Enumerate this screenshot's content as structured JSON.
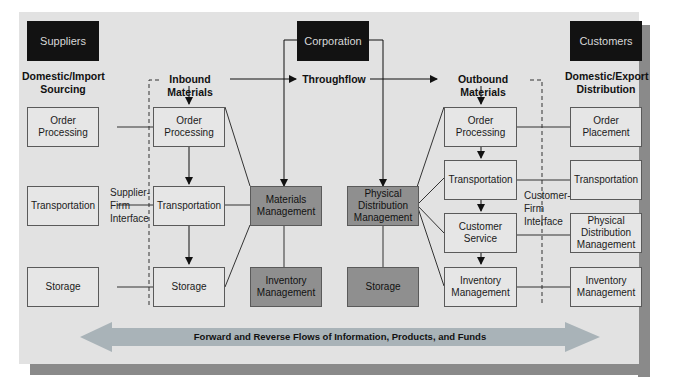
{
  "diagram": {
    "title_boxes": {
      "suppliers": "Suppliers",
      "corporation": "Corporation",
      "customers": "Customers"
    },
    "headings": {
      "domestic_import": "Domestic/Import\nSourcing",
      "inbound": "Inbound Materials",
      "throughflow": "Throughflow",
      "outbound": "Outbound Materials",
      "domestic_export": "Domestic/Export\nDistribution"
    },
    "supplier_column": [
      "Order\nProcessing",
      "Transportation",
      "Storage"
    ],
    "inbound_column": [
      "Order\nProcessing",
      "Transportation",
      "Storage"
    ],
    "materials": {
      "materials_management": "Materials\nManagement",
      "inventory_management": "Inventory\nManagement"
    },
    "distribution": {
      "physical_distribution": "Physical\nDistribution\nManagement",
      "storage": "Storage"
    },
    "outbound_column": [
      "Order\nProcessing",
      "Transportation",
      "Customer\nService",
      "Inventory\nManagement"
    ],
    "customer_column": [
      "Order\nPlacement",
      "Transportation",
      "Physical\nDistribution\nManagement",
      "Inventory\nManagement"
    ],
    "interfaces": {
      "supplier_firm": "Supplier-\nFirm\nInterface",
      "customer_firm": "Customer-\nFirm\nInterface"
    },
    "flow_banner": "Forward and Reverse Flows of Information, Products, and Funds",
    "colors": {
      "panel": "#e2e2e2",
      "dark_box": "#121212",
      "mid_box": "#8f8f8f",
      "light_box": "#e6e6e6",
      "flow_arrow": "#a9b3b8",
      "shadow": "#8a8a8a"
    }
  }
}
